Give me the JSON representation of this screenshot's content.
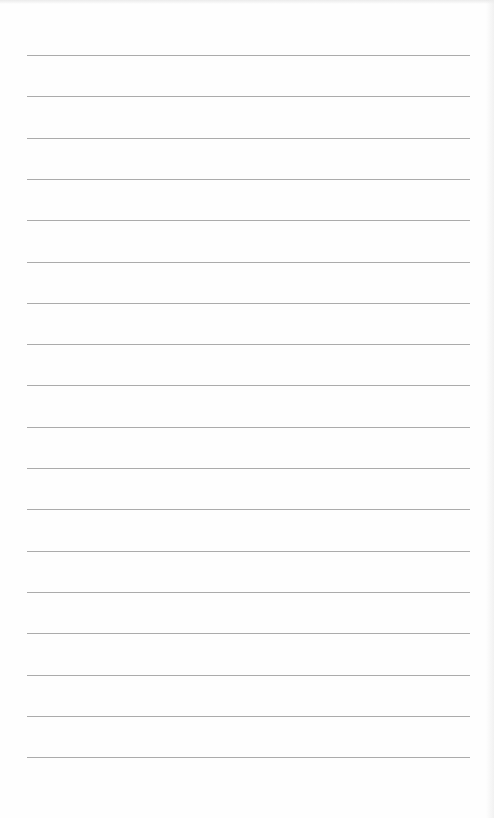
{
  "page": {
    "type": "lined-paper",
    "background_color": "#fefefe",
    "rule_color": "#9c9c9c",
    "rule_count": 18,
    "rules_y": [
      55,
      96,
      138,
      179,
      220,
      262,
      303,
      344,
      385,
      427,
      468,
      509,
      551,
      592,
      633,
      675,
      716,
      757
    ],
    "rule_left": 27,
    "rule_right": 470,
    "text": []
  }
}
